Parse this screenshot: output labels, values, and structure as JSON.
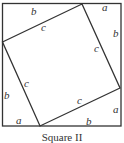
{
  "caption": "Square II",
  "outer_square": {
    "side_segments": [
      "a",
      "b"
    ]
  },
  "inner_square": {
    "side_label": "c"
  },
  "labels": {
    "top_b": "b",
    "top_a": "a",
    "right_b": "b",
    "right_a": "a",
    "bottom_b": "b",
    "bottom_a": "a",
    "left_b": "b",
    "c_top": "c",
    "c_right": "c",
    "c_bottom": "c",
    "c_left": "c"
  },
  "colors": {
    "line": "#333333",
    "background": "#ffffff"
  }
}
